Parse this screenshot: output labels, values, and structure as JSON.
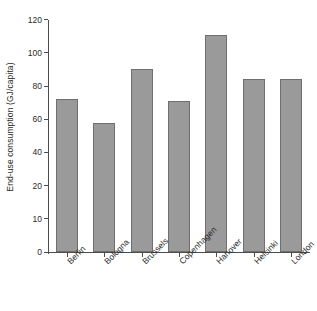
{
  "chart_data": {
    "type": "bar",
    "title": "",
    "xlabel": "",
    "ylabel": "End-use consumption (GJ/capita)",
    "categories": [
      "Berlin",
      "Bologna",
      "Brussels",
      "Copenhagen",
      "Hanover",
      "Helsinki",
      "London"
    ],
    "values": [
      72,
      58,
      90,
      71,
      111,
      84.5,
      84
    ],
    "series": [
      {
        "name": "End-use consumption",
        "values": [
          72,
          58,
          90,
          71,
          111,
          84.5,
          84
        ]
      }
    ],
    "yticks": [
      0,
      10,
      20,
      40,
      60,
      80,
      100,
      120
    ],
    "ytick_labels": [
      "0",
      "10",
      "20",
      "40",
      "60",
      "80",
      "100",
      "120"
    ],
    "ylim": [
      0,
      120
    ],
    "grid": false,
    "legend": false,
    "legend_position": "none",
    "bar_color": "#9a9a9a",
    "bar_edge_color": "#6f6f6f",
    "axis_color": "#4d4d4d",
    "background_color": "#ffffff",
    "xtick_label_rotation": 45,
    "note": "Y axis tick spacing is non-uniform: 0, 10 and 20 are spaced at the same pixel interval as the 20-unit steps above 20."
  }
}
